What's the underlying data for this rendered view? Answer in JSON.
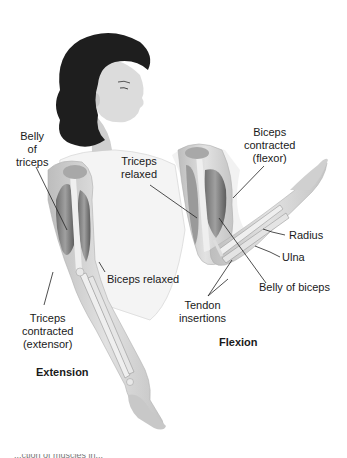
{
  "figure": {
    "extension": {
      "title": "Extension",
      "labels": {
        "belly_of_triceps": [
          "Belly",
          "of",
          "triceps"
        ],
        "biceps_relaxed": "Biceps relaxed",
        "triceps_contracted": [
          "Triceps",
          "contracted",
          "(extensor)"
        ]
      }
    },
    "flexion": {
      "title": "Flexion",
      "labels": {
        "biceps_contracted": [
          "Biceps",
          "contracted",
          "(flexor)"
        ],
        "triceps_relaxed": [
          "Triceps",
          "relaxed"
        ],
        "radius": "Radius",
        "ulna": "Ulna",
        "belly_of_biceps": "Belly of biceps",
        "tendon_insertions": [
          "Tendon",
          "insertions"
        ]
      }
    },
    "caption_fragment": "...ction of muscles in..."
  },
  "colors": {
    "background": "#ffffff",
    "hair": "#1e1e1e",
    "skin": "#d9d9d9",
    "muscle": "#8a8a8a",
    "muscle_dark": "#5a5a5a",
    "bone": "#efefef",
    "text": "#1a1a1a",
    "leader_line": "#222222"
  }
}
